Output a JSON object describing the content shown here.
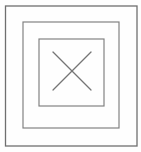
{
  "figure": {
    "title": "Nested squares with diagonal cross",
    "canvas": {
      "width": 141,
      "height": 152,
      "background_color": "#fefefe"
    },
    "style": {
      "line_color": "#7d7d7d",
      "line_color_dark": "#6a6a6a",
      "cross_color": "#757575",
      "stroke_width": 1.1,
      "outer_stroke_width": 1.3
    },
    "shapes": [
      {
        "name": "outer-square",
        "label": "Outer square",
        "kind": "rect",
        "x": 5.5,
        "y": 6.0,
        "width": 131.5,
        "height": 140.0,
        "stroke": "#6f6f6f",
        "stroke_width": 1.3
      },
      {
        "name": "middle-square",
        "label": "Middle square",
        "kind": "rect",
        "x": 23.0,
        "y": 22.0,
        "width": 96.0,
        "height": 106.0,
        "stroke": "#7d7d7d",
        "stroke_width": 1.15
      },
      {
        "name": "inner-square",
        "label": "Inner square",
        "kind": "rect",
        "x": 39.0,
        "y": 39.0,
        "width": 65.0,
        "height": 67.0,
        "stroke": "#7d7d7d",
        "stroke_width": 1.15
      }
    ],
    "cross": {
      "name": "cross-mark",
      "label": "X mark",
      "center": {
        "x": 72,
        "y": 71
      },
      "stroke": "#757575",
      "stroke_width": 1.2,
      "lines": [
        {
          "name": "cross-line-nw-se",
          "x1": 53,
          "y1": 52,
          "x2": 91,
          "y2": 90
        },
        {
          "name": "cross-line-ne-sw",
          "x1": 91,
          "y1": 52,
          "x2": 53,
          "y2": 90
        }
      ]
    }
  }
}
